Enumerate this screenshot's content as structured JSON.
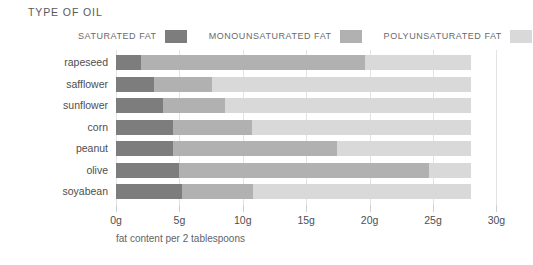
{
  "header": {
    "title": "TYPE OF OIL"
  },
  "legend": {
    "items": [
      {
        "label": "SATURATED FAT",
        "color": "#7d7d7d",
        "key": "saturated"
      },
      {
        "label": "MONOUNSATURATED FAT",
        "color": "#b1b1b1",
        "key": "monounsaturated"
      },
      {
        "label": "POLYUNSATURATED FAT",
        "color": "#d9d9d9",
        "key": "polyunsaturated"
      }
    ]
  },
  "axis": {
    "tick_labels": [
      "0g",
      "5g",
      "10g",
      "15g",
      "20g",
      "25g",
      "30g"
    ],
    "tick_values": [
      0,
      5,
      10,
      15,
      20,
      25,
      30
    ]
  },
  "caption": "fat content per 2 tablespoons",
  "chart_data": {
    "type": "bar",
    "orientation": "horizontal",
    "stacked": true,
    "title": "TYPE OF OIL",
    "xlabel": "fat content per 2 tablespoons",
    "ylabel": "",
    "xlim": [
      0,
      30
    ],
    "xtick_labels": [
      "0g",
      "5g",
      "10g",
      "15g",
      "20g",
      "25g",
      "30g"
    ],
    "xticks": [
      0,
      5,
      10,
      15,
      20,
      25,
      30
    ],
    "grid": true,
    "legend_position": "top",
    "categories": [
      "rapeseed",
      "safflower",
      "sunflower",
      "corn",
      "peanut",
      "olive",
      "soyabean"
    ],
    "series": [
      {
        "name": "SATURATED FAT",
        "color": "#7d7d7d",
        "values": [
          2.0,
          3.0,
          3.7,
          4.5,
          4.5,
          5.0,
          5.2
        ]
      },
      {
        "name": "MONOUNSATURATED FAT",
        "color": "#b1b1b1",
        "values": [
          17.6,
          4.6,
          4.9,
          6.2,
          12.9,
          19.7,
          5.6
        ]
      },
      {
        "name": "POLYUNSATURATED FAT",
        "color": "#d9d9d9",
        "values": [
          8.4,
          20.4,
          19.4,
          17.3,
          10.6,
          3.3,
          17.2
        ]
      }
    ],
    "totals": [
      28,
      28,
      28,
      28,
      28,
      28,
      28
    ]
  }
}
